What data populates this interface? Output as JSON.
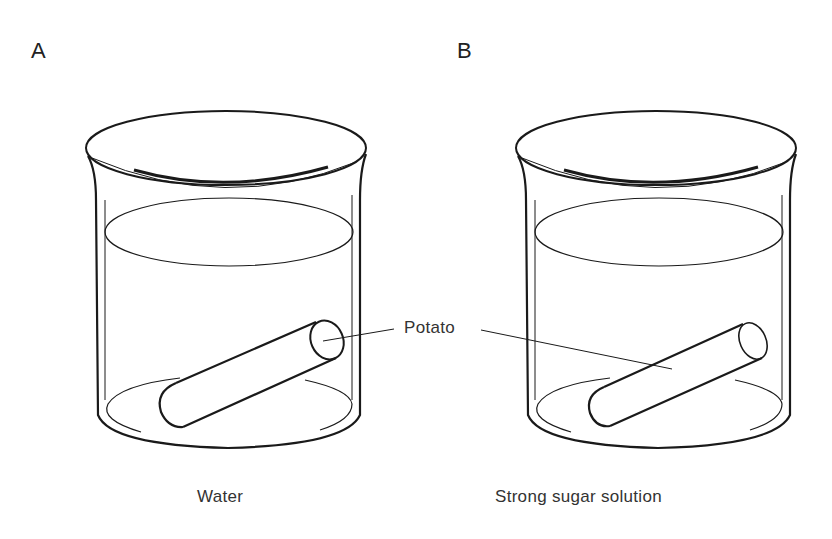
{
  "panels": [
    {
      "label": "A",
      "caption": "Water"
    },
    {
      "label": "B",
      "caption": "Strong sugar solution"
    }
  ],
  "callout": {
    "label": "Potato"
  },
  "style": {
    "stroke": "#1a1a1a",
    "background": "#ffffff"
  }
}
